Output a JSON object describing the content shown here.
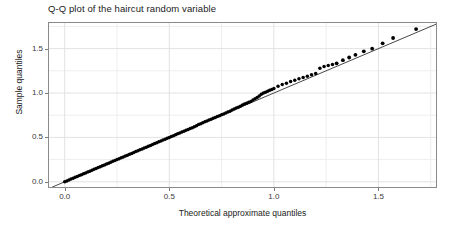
{
  "chart_data": {
    "type": "scatter",
    "title": "Q-Q plot of the haircut random variable",
    "xlabel": "Theoretical approximate quantiles",
    "ylabel": "Sample quantiles",
    "xlim": [
      -0.08,
      1.78
    ],
    "ylim": [
      -0.07,
      1.8
    ],
    "xticks": [
      0.0,
      0.5,
      1.0,
      1.5
    ],
    "xticklabels": [
      "0.0",
      "0.5",
      "1.0",
      "1.5"
    ],
    "yticks": [
      0.0,
      0.5,
      1.0,
      1.5
    ],
    "yticklabels": [
      "0.0",
      "0.5",
      "1.0",
      "1.5"
    ],
    "grid": true,
    "grid_minor_x": [
      0.25,
      0.75,
      1.25,
      1.75
    ],
    "grid_minor_y": [
      0.25,
      0.75,
      1.25,
      1.75
    ],
    "legend": null,
    "marker": "filled-circle",
    "marker_color": "#000000",
    "reference_line": {
      "name": "y = x identity line",
      "color": "#333333",
      "slope": 1.0,
      "intercept": 0.0,
      "x_start": -0.06,
      "x_end": 1.78
    },
    "series": [
      {
        "name": "sample vs theoretical quantiles",
        "x": [
          0.0,
          0.01,
          0.02,
          0.03,
          0.04,
          0.05,
          0.06,
          0.07,
          0.08,
          0.09,
          0.1,
          0.11,
          0.12,
          0.13,
          0.14,
          0.15,
          0.16,
          0.17,
          0.18,
          0.19,
          0.2,
          0.21,
          0.22,
          0.23,
          0.24,
          0.25,
          0.26,
          0.27,
          0.28,
          0.29,
          0.3,
          0.31,
          0.32,
          0.33,
          0.34,
          0.35,
          0.36,
          0.37,
          0.38,
          0.39,
          0.4,
          0.41,
          0.42,
          0.43,
          0.44,
          0.45,
          0.46,
          0.47,
          0.48,
          0.49,
          0.5,
          0.51,
          0.52,
          0.53,
          0.54,
          0.55,
          0.56,
          0.57,
          0.58,
          0.59,
          0.6,
          0.61,
          0.62,
          0.63,
          0.64,
          0.65,
          0.66,
          0.67,
          0.68,
          0.69,
          0.7,
          0.71,
          0.72,
          0.73,
          0.74,
          0.75,
          0.76,
          0.77,
          0.78,
          0.79,
          0.8,
          0.81,
          0.82,
          0.83,
          0.84,
          0.85,
          0.86,
          0.87,
          0.88,
          0.89,
          0.9,
          0.91,
          0.92,
          0.93,
          0.94,
          0.95,
          0.96,
          0.97,
          0.98,
          0.99,
          1.0,
          1.02,
          1.04,
          1.06,
          1.08,
          1.1,
          1.12,
          1.14,
          1.16,
          1.18,
          1.2,
          1.22,
          1.24,
          1.26,
          1.28,
          1.3,
          1.33,
          1.36,
          1.39,
          1.43,
          1.47,
          1.52,
          1.57,
          1.68
        ],
        "y": [
          0.0,
          0.01,
          0.02,
          0.03,
          0.04,
          0.05,
          0.06,
          0.07,
          0.08,
          0.09,
          0.1,
          0.11,
          0.12,
          0.13,
          0.14,
          0.15,
          0.16,
          0.17,
          0.18,
          0.19,
          0.2,
          0.21,
          0.22,
          0.23,
          0.24,
          0.25,
          0.26,
          0.27,
          0.28,
          0.29,
          0.3,
          0.31,
          0.32,
          0.33,
          0.34,
          0.35,
          0.36,
          0.37,
          0.38,
          0.39,
          0.4,
          0.41,
          0.42,
          0.43,
          0.44,
          0.45,
          0.46,
          0.47,
          0.48,
          0.49,
          0.5,
          0.51,
          0.52,
          0.53,
          0.54,
          0.55,
          0.56,
          0.57,
          0.58,
          0.59,
          0.6,
          0.61,
          0.62,
          0.63,
          0.645,
          0.655,
          0.665,
          0.675,
          0.685,
          0.695,
          0.705,
          0.715,
          0.725,
          0.735,
          0.745,
          0.755,
          0.765,
          0.775,
          0.785,
          0.795,
          0.81,
          0.82,
          0.83,
          0.84,
          0.85,
          0.865,
          0.875,
          0.885,
          0.895,
          0.905,
          0.92,
          0.935,
          0.95,
          0.965,
          0.985,
          1.0,
          1.01,
          1.02,
          1.03,
          1.04,
          1.05,
          1.075,
          1.095,
          1.11,
          1.13,
          1.145,
          1.16,
          1.175,
          1.19,
          1.205,
          1.22,
          1.28,
          1.3,
          1.31,
          1.32,
          1.335,
          1.37,
          1.4,
          1.43,
          1.47,
          1.5,
          1.56,
          1.62,
          1.72
        ]
      }
    ]
  },
  "axes": {
    "y_tick_labels": [
      "1.5",
      "1.0",
      "0.5",
      "0.0"
    ],
    "x_tick_labels": [
      "0.0",
      "0.5",
      "1.0",
      "1.5"
    ]
  },
  "colors": {
    "background": "#ffffff",
    "panel_border": "#808080",
    "gridline_major": "#e2e2e2",
    "gridline_minor": "#eeeeee",
    "marker": "#000000",
    "reference_line": "#444444",
    "tick_label": "#3a3a3a",
    "title": "#1a1a1a"
  }
}
